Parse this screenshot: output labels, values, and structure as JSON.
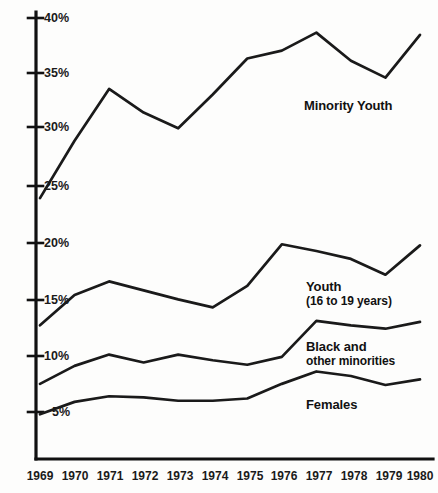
{
  "chart_data": {
    "type": "line",
    "title": "",
    "subtitle": "",
    "xlabel": "",
    "ylabel": "",
    "grid": false,
    "legend_position": "inline-annotations",
    "x": [
      1969,
      1970,
      1971,
      1972,
      1973,
      1974,
      1975,
      1976,
      1977,
      1978,
      1979,
      1980
    ],
    "x_tick_labels": [
      "1969",
      "1970",
      "1971",
      "1972",
      "1973",
      "1974",
      "1975",
      "1976",
      "1977",
      "1978",
      "1979",
      "1980"
    ],
    "y_tick_labels": [
      "40%",
      "35%",
      "30%",
      "25%",
      "20%",
      "15%",
      "10%",
      "5%"
    ],
    "y_ticks": [
      40,
      35,
      30,
      25,
      20,
      15,
      10,
      5
    ],
    "ylim": [
      2.2,
      41.8
    ],
    "xlim": [
      1968.8,
      1980.3
    ],
    "units": "percent",
    "series": [
      {
        "name": "Minority Youth",
        "label": "Minority Youth",
        "color": "#1a1a1a",
        "values": [
          24.0,
          29.1,
          33.7,
          31.6,
          30.2,
          33.2,
          36.4,
          37.1,
          38.7,
          36.2,
          34.7,
          38.5
        ]
      },
      {
        "name": "Youth",
        "label": "Youth",
        "sublabel": "(16 to 19 years)",
        "color": "#1a1a1a",
        "values": [
          12.7,
          15.4,
          16.6,
          15.8,
          15.0,
          14.3,
          16.2,
          19.9,
          19.3,
          18.6,
          17.2,
          19.8
        ]
      },
      {
        "name": "Black and other minorities",
        "label": "Black and",
        "sublabel": "other minorities",
        "color": "#1a1a1a",
        "values": [
          7.5,
          9.1,
          10.1,
          9.4,
          10.1,
          9.6,
          9.2,
          9.9,
          13.1,
          12.7,
          12.4,
          13.0
        ]
      },
      {
        "name": "Females",
        "label": "Females",
        "color": "#1a1a1a",
        "values": [
          4.8,
          5.9,
          6.4,
          6.3,
          6.0,
          6.0,
          6.2,
          7.5,
          8.6,
          8.2,
          7.4,
          7.9
        ]
      }
    ],
    "annotations": [
      {
        "text": "Minority Youth",
        "x": 1977.2,
        "y": 35.2
      },
      {
        "text": "Youth",
        "x": 1977.0,
        "y": 17.5
      },
      {
        "text": "(16 to 19 years)",
        "x": 1977.0,
        "y": 16.3
      },
      {
        "text": "Black and",
        "x": 1977.2,
        "y": 11.5
      },
      {
        "text": "other minorities",
        "x": 1977.2,
        "y": 10.4
      },
      {
        "text": "Females",
        "x": 1977.2,
        "y": 6.2
      }
    ]
  },
  "axes": {
    "y_ticks": [
      {
        "label": "40%",
        "py": 18
      },
      {
        "label": "35%",
        "py": 73
      },
      {
        "label": "30%",
        "py": 127
      },
      {
        "label": "25%",
        "py": 186
      },
      {
        "label": "20%",
        "py": 243
      },
      {
        "label": "15%",
        "py": 300
      },
      {
        "label": "10%",
        "py": 356
      },
      {
        "label": "5%",
        "py": 412
      }
    ],
    "x_ticks": [
      {
        "label": "1969",
        "px": 40
      },
      {
        "label": "1970",
        "px": 75
      },
      {
        "label": "1971",
        "px": 110
      },
      {
        "label": "1972",
        "px": 145
      },
      {
        "label": "1973",
        "px": 180
      },
      {
        "label": "1974",
        "px": 215
      },
      {
        "label": "1975",
        "px": 250
      },
      {
        "label": "1976",
        "px": 284
      },
      {
        "label": "1977",
        "px": 319
      },
      {
        "label": "1978",
        "px": 354
      },
      {
        "label": "1979",
        "px": 389
      },
      {
        "label": "1980",
        "px": 420
      }
    ]
  },
  "series_labels": {
    "minority_youth": {
      "text": "Minority Youth",
      "px": 304,
      "py": 99
    },
    "youth": {
      "text": "Youth",
      "sub": "(16 to 19 years)",
      "px": 306,
      "py": 280
    },
    "black_other": {
      "text": "Black and",
      "sub": "other minorities",
      "px": 306,
      "py": 340
    },
    "females": {
      "text": "Females",
      "px": 306,
      "py": 398
    }
  },
  "style": {
    "line_color": "#1a1a1a",
    "axis_color": "#111111",
    "background": "#fdfdfc",
    "text_color": "#141414"
  }
}
